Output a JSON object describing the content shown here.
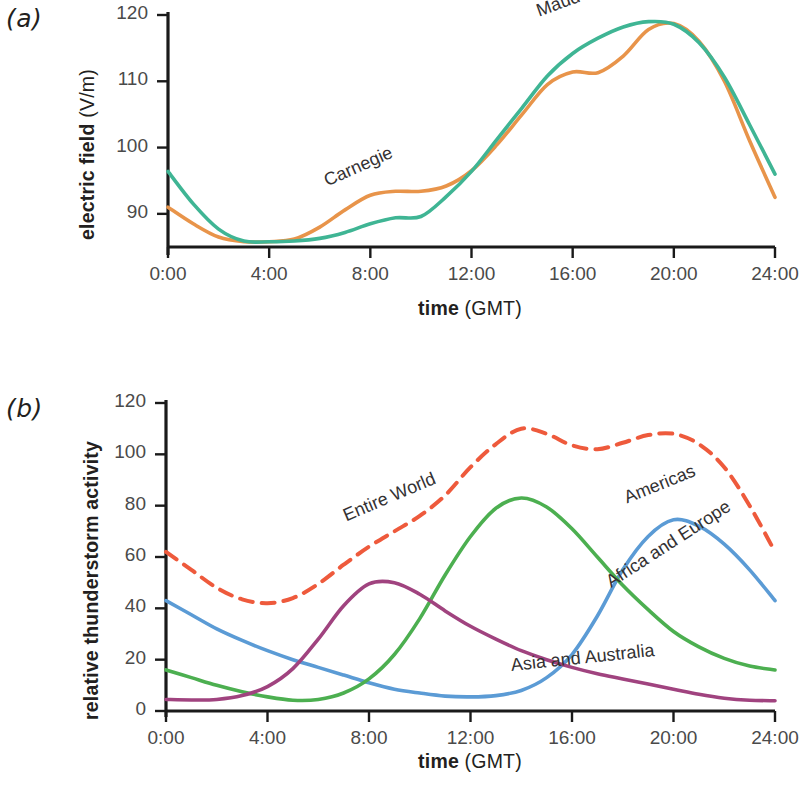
{
  "figure": {
    "panels": [
      {
        "label": "(a)",
        "ylabel_bold": "electric field",
        "ylabel_reg": "(V/m)",
        "xlabel_bold": "time",
        "xlabel_reg": "(GMT)"
      },
      {
        "label": "(b)",
        "ylabel_bold": "relative thunderstorm activity",
        "ylabel_reg": "",
        "xlabel_bold": "time",
        "xlabel_reg": "(GMT)"
      }
    ]
  },
  "chart_data": [
    {
      "type": "line",
      "title": "",
      "panel": "(a)",
      "xlabel": "time (GMT)",
      "ylabel": "electric field (V/m)",
      "xlim": [
        0,
        24
      ],
      "ylim": [
        85,
        120
      ],
      "xticks": [
        0,
        4,
        8,
        12,
        16,
        20,
        24
      ],
      "xticklabels": [
        "0:00",
        "4:00",
        "8:00",
        "12:00",
        "16:00",
        "20:00",
        "24:00"
      ],
      "yticks": [
        90,
        100,
        110,
        120
      ],
      "yticklabels": [
        "90",
        "100",
        "110",
        "120"
      ],
      "grid": false,
      "legend": "inline-curve-labels",
      "x": [
        0,
        1,
        2,
        3,
        4,
        5,
        6,
        7,
        8,
        9,
        10,
        11,
        12,
        13,
        14,
        15,
        16,
        17,
        18,
        19,
        20,
        21,
        22,
        23,
        24
      ],
      "series": [
        {
          "name": "Carnegie",
          "color": "#E8944A",
          "style": "solid",
          "label_x": 6.2,
          "label_y": 95.0,
          "label_rotation": -24,
          "values": [
            91.0,
            88.5,
            86.5,
            85.8,
            85.8,
            86.2,
            88.0,
            90.6,
            92.8,
            93.4,
            93.4,
            94.2,
            96.5,
            100.4,
            105.0,
            109.5,
            111.4,
            111.3,
            113.8,
            117.8,
            118.7,
            116.0,
            110.0,
            101.0,
            92.5
          ]
        },
        {
          "name": "Maud",
          "color": "#3FB594",
          "style": "solid",
          "label_x": 14.6,
          "label_y": 120.6,
          "label_rotation": -20,
          "values": [
            96.4,
            91.5,
            87.7,
            85.9,
            85.8,
            85.9,
            86.3,
            87.2,
            88.5,
            89.4,
            89.6,
            92.6,
            96.4,
            101.2,
            106.0,
            110.8,
            114.2,
            116.5,
            118.2,
            119.0,
            118.6,
            115.8,
            110.6,
            103.4,
            96.0
          ]
        }
      ]
    },
    {
      "type": "line",
      "title": "",
      "panel": "(b)",
      "xlabel": "time (GMT)",
      "ylabel": "relative thunderstorm activity",
      "xlim": [
        0,
        24
      ],
      "ylim": [
        0,
        120
      ],
      "xticks": [
        0,
        4,
        8,
        12,
        16,
        20,
        24
      ],
      "xticklabels": [
        "0:00",
        "4:00",
        "8:00",
        "12:00",
        "16:00",
        "20:00",
        "24:00"
      ],
      "yticks": [
        0,
        20,
        40,
        60,
        80,
        100,
        120
      ],
      "yticklabels": [
        "0",
        "20",
        "40",
        "60",
        "80",
        "100",
        "120"
      ],
      "grid": false,
      "legend": "inline-curve-labels",
      "x": [
        0,
        1,
        2,
        3,
        4,
        5,
        6,
        7,
        8,
        9,
        10,
        11,
        12,
        13,
        14,
        15,
        16,
        17,
        18,
        19,
        20,
        21,
        22,
        23,
        24
      ],
      "series": [
        {
          "name": "Entire World",
          "color": "#EE5A3C",
          "style": "dashed",
          "label_x": 7.0,
          "label_y": 76.0,
          "label_rotation": -23,
          "values": [
            62.0,
            55.0,
            48.0,
            43.5,
            42.0,
            44.0,
            49.5,
            57.0,
            64.0,
            70.0,
            76.0,
            84.0,
            95.0,
            104.0,
            110.0,
            108.0,
            103.5,
            102.0,
            104.5,
            107.5,
            108.0,
            104.0,
            95.0,
            80.0,
            62.0
          ]
        },
        {
          "name": "Americas",
          "color": "#5B9BD5",
          "style": "solid",
          "label_x": 18.1,
          "label_y": 83.0,
          "label_rotation": -22,
          "values": [
            43.0,
            37.5,
            32.0,
            27.5,
            23.5,
            20.0,
            17.0,
            14.0,
            11.0,
            8.5,
            7.0,
            5.8,
            5.5,
            6.0,
            8.0,
            13.0,
            22.0,
            37.0,
            55.0,
            68.0,
            74.5,
            72.0,
            65.0,
            55.0,
            43.0
          ]
        },
        {
          "name": "Africa and Europe",
          "color": "#4CAF50",
          "style": "solid",
          "label_x": 17.4,
          "label_y": 50.0,
          "label_rotation": -33,
          "values": [
            16.0,
            13.0,
            10.0,
            7.5,
            5.5,
            4.2,
            4.5,
            7.0,
            12.5,
            22.0,
            36.0,
            53.0,
            68.0,
            79.0,
            83.0,
            79.5,
            71.0,
            60.0,
            49.0,
            39.5,
            31.0,
            25.0,
            20.5,
            17.5,
            16.0
          ]
        },
        {
          "name": "Asia and Australia",
          "color": "#A0437F",
          "style": "solid",
          "label_x": 13.6,
          "label_y": 18.0,
          "label_rotation": -6,
          "values": [
            4.5,
            4.3,
            4.5,
            6.0,
            9.5,
            16.5,
            28.0,
            41.0,
            49.5,
            50.0,
            45.5,
            39.0,
            33.0,
            28.0,
            23.5,
            20.0,
            17.0,
            14.5,
            12.5,
            10.5,
            8.5,
            6.5,
            5.0,
            4.2,
            4.0
          ]
        }
      ]
    }
  ]
}
